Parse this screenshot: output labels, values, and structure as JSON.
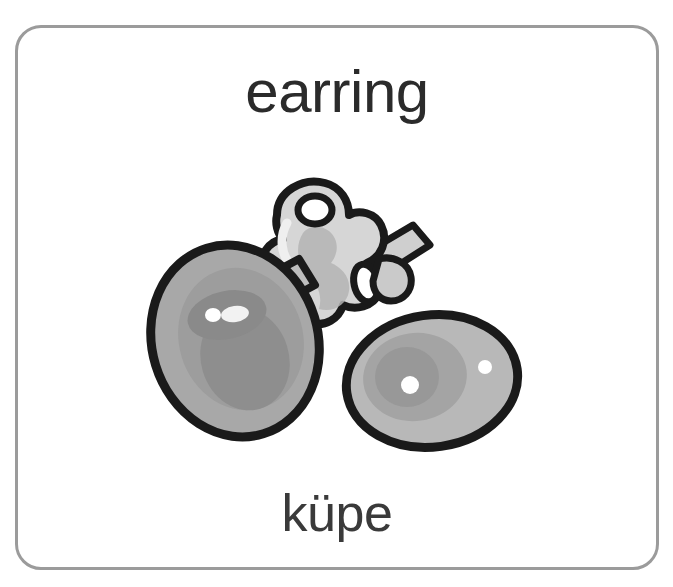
{
  "card": {
    "word_english": "earring",
    "word_turkish": "küpe",
    "border_color": "#9b9b9b",
    "background_color": "#ffffff",
    "text_color": "#2b2b2b"
  },
  "illustration": {
    "name": "pair-of-pearl-earrings",
    "description": "Two grayscale oval pearl earrings with a metallic clasp post between them",
    "parts": [
      {
        "name": "left-pearl",
        "shape": "tilted-ellipse",
        "fill": "#a8a8a8",
        "shade": "#8f8f8f",
        "outline": "#1a1a1a",
        "highlights": 2
      },
      {
        "name": "clasp-hook",
        "shape": "metal-butterfly-clasp",
        "fill": "#d6d6d6",
        "shade": "#b0b0b0",
        "outline": "#1a1a1a"
      },
      {
        "name": "post-bar",
        "shape": "diagonal-bar",
        "fill": "#bdbdbd",
        "outline": "#1a1a1a"
      },
      {
        "name": "right-pearl",
        "shape": "horizontal-ellipse",
        "fill": "#b8b8b8",
        "shade": "#9a9a9a",
        "outline": "#1a1a1a",
        "highlights": 2
      }
    ],
    "colors": {
      "outline": "#1a1a1a",
      "pearl_light": "#b8b8b8",
      "pearl_mid": "#a8a8a8",
      "pearl_dark": "#8f8f8f",
      "metal_light": "#dcdcdc",
      "metal_mid": "#c2c2c2",
      "metal_shadow": "#9d9d9d",
      "highlight": "#ffffff"
    }
  }
}
